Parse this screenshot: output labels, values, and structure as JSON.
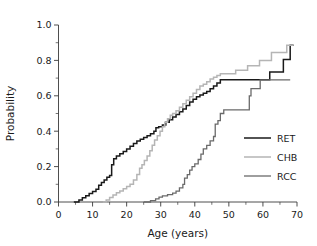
{
  "chart_data": {
    "type": "line",
    "title": "",
    "subtitle": "",
    "xlabel": "Age  (years)",
    "ylabel": "Probability",
    "xlim": [
      0,
      70
    ],
    "ylim": [
      0.0,
      1.0
    ],
    "xticks": [
      0,
      10,
      20,
      30,
      40,
      50,
      60,
      70
    ],
    "xticklabels": [
      "0",
      "10",
      "20",
      "30",
      "40",
      "50",
      "60",
      "70"
    ],
    "xminorticks": [
      5,
      15,
      25,
      35,
      45,
      55,
      65
    ],
    "yticks": [
      0.0,
      0.2,
      0.4,
      0.6,
      0.8,
      1.0
    ],
    "yticklabels": [
      "0.0",
      "0.2",
      "0.4",
      "0.6",
      "0.8",
      "1.0"
    ],
    "yminorticks": [
      0.1,
      0.3,
      0.5,
      0.7,
      0.9
    ],
    "grid": false,
    "legend_position": "center-right",
    "interpolation": "step-post",
    "series": [
      {
        "name": "RET",
        "color": "#1a1a1a",
        "width": 1.5,
        "points": [
          [
            4.5,
            0.0
          ],
          [
            6.0,
            0.012
          ],
          [
            7.0,
            0.024
          ],
          [
            8.0,
            0.036
          ],
          [
            9.0,
            0.048
          ],
          [
            10.0,
            0.06
          ],
          [
            11.0,
            0.072
          ],
          [
            11.8,
            0.095
          ],
          [
            12.6,
            0.11
          ],
          [
            13.4,
            0.125
          ],
          [
            14.2,
            0.14
          ],
          [
            15.0,
            0.15
          ],
          [
            15.6,
            0.21
          ],
          [
            16.2,
            0.245
          ],
          [
            17.0,
            0.26
          ],
          [
            18.0,
            0.272
          ],
          [
            19.0,
            0.285
          ],
          [
            20.0,
            0.3
          ],
          [
            21.0,
            0.315
          ],
          [
            22.0,
            0.33
          ],
          [
            23.0,
            0.345
          ],
          [
            24.0,
            0.355
          ],
          [
            25.0,
            0.365
          ],
          [
            26.0,
            0.375
          ],
          [
            27.0,
            0.385
          ],
          [
            28.0,
            0.4
          ],
          [
            28.6,
            0.42
          ],
          [
            29.4,
            0.425
          ],
          [
            30.5,
            0.435
          ],
          [
            31.5,
            0.45
          ],
          [
            32.5,
            0.465
          ],
          [
            33.5,
            0.48
          ],
          [
            34.5,
            0.495
          ],
          [
            35.5,
            0.51
          ],
          [
            36.5,
            0.525
          ],
          [
            37.5,
            0.545
          ],
          [
            38.5,
            0.565
          ],
          [
            39.5,
            0.58
          ],
          [
            40.5,
            0.595
          ],
          [
            41.5,
            0.605
          ],
          [
            42.5,
            0.615
          ],
          [
            43.5,
            0.625
          ],
          [
            44.5,
            0.64
          ],
          [
            45.5,
            0.655
          ],
          [
            46.5,
            0.672
          ],
          [
            47.5,
            0.69
          ],
          [
            61.5,
            0.69
          ],
          [
            62.0,
            0.735
          ],
          [
            65.5,
            0.735
          ],
          [
            66.0,
            0.805
          ],
          [
            67.5,
            0.805
          ],
          [
            68.0,
            0.885
          ],
          [
            69.0,
            0.885
          ]
        ]
      },
      {
        "name": "CHB",
        "color": "#b5b5b5",
        "width": 1.5,
        "points": [
          [
            13.0,
            0.0
          ],
          [
            14.0,
            0.012
          ],
          [
            15.0,
            0.025
          ],
          [
            16.0,
            0.04
          ],
          [
            17.0,
            0.052
          ],
          [
            18.0,
            0.062
          ],
          [
            19.0,
            0.075
          ],
          [
            20.0,
            0.088
          ],
          [
            21.0,
            0.1
          ],
          [
            22.0,
            0.125
          ],
          [
            23.0,
            0.155
          ],
          [
            23.8,
            0.19
          ],
          [
            24.5,
            0.21
          ],
          [
            25.2,
            0.235
          ],
          [
            26.0,
            0.26
          ],
          [
            26.8,
            0.29
          ],
          [
            27.5,
            0.32
          ],
          [
            28.2,
            0.35
          ],
          [
            29.0,
            0.375
          ],
          [
            29.8,
            0.4
          ],
          [
            30.5,
            0.425
          ],
          [
            31.2,
            0.45
          ],
          [
            32.0,
            0.47
          ],
          [
            32.8,
            0.49
          ],
          [
            33.5,
            0.5
          ],
          [
            34.5,
            0.515
          ],
          [
            35.5,
            0.535
          ],
          [
            36.5,
            0.555
          ],
          [
            37.5,
            0.575
          ],
          [
            38.5,
            0.595
          ],
          [
            39.5,
            0.615
          ],
          [
            40.5,
            0.635
          ],
          [
            41.5,
            0.655
          ],
          [
            42.5,
            0.665
          ],
          [
            43.5,
            0.68
          ],
          [
            44.5,
            0.695
          ],
          [
            45.5,
            0.705
          ],
          [
            46.5,
            0.715
          ],
          [
            47.5,
            0.725
          ],
          [
            51.5,
            0.725
          ],
          [
            52.0,
            0.745
          ],
          [
            55.0,
            0.745
          ],
          [
            55.5,
            0.77
          ],
          [
            58.5,
            0.77
          ],
          [
            59.0,
            0.8
          ],
          [
            62.0,
            0.8
          ],
          [
            62.5,
            0.845
          ],
          [
            66.5,
            0.845
          ],
          [
            67.0,
            0.885
          ],
          [
            69.0,
            0.885
          ]
        ]
      },
      {
        "name": "RCC",
        "color": "#6a6a6a",
        "width": 1.3,
        "points": [
          [
            25.0,
            0.0
          ],
          [
            27.0,
            0.008
          ],
          [
            28.5,
            0.018
          ],
          [
            29.5,
            0.028
          ],
          [
            30.5,
            0.035
          ],
          [
            32.0,
            0.042
          ],
          [
            33.5,
            0.05
          ],
          [
            34.5,
            0.062
          ],
          [
            35.5,
            0.08
          ],
          [
            36.5,
            0.1
          ],
          [
            37.0,
            0.135
          ],
          [
            37.8,
            0.155
          ],
          [
            38.5,
            0.18
          ],
          [
            39.2,
            0.2
          ],
          [
            40.0,
            0.215
          ],
          [
            41.0,
            0.24
          ],
          [
            41.8,
            0.27
          ],
          [
            42.5,
            0.3
          ],
          [
            43.5,
            0.32
          ],
          [
            44.5,
            0.345
          ],
          [
            45.5,
            0.37
          ],
          [
            46.0,
            0.44
          ],
          [
            46.8,
            0.46
          ],
          [
            47.5,
            0.5
          ],
          [
            48.5,
            0.52
          ],
          [
            55.5,
            0.52
          ],
          [
            56.0,
            0.6
          ],
          [
            56.5,
            0.64
          ],
          [
            58.8,
            0.64
          ],
          [
            59.2,
            0.69
          ],
          [
            60.0,
            0.69
          ],
          [
            68.0,
            0.69
          ]
        ]
      }
    ]
  },
  "legend": {
    "entries": [
      {
        "label": "RET",
        "color": "#1a1a1a"
      },
      {
        "label": "CHB",
        "color": "#b5b5b5"
      },
      {
        "label": "RCC",
        "color": "#6a6a6a"
      }
    ]
  }
}
